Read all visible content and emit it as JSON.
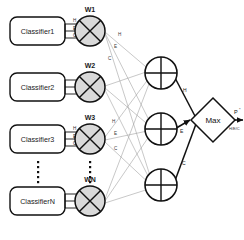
{
  "diagram": {
    "classifiers": [
      {
        "label": "Classifier1",
        "weight_label": "W1"
      },
      {
        "label": "Classifier2",
        "weight_label": "W2"
      },
      {
        "label": "Classifier3",
        "weight_label": "W3"
      },
      {
        "label": "ClassifierN",
        "weight_label": "WN"
      }
    ],
    "class_labels": [
      "H",
      "E",
      "C"
    ],
    "sum_nodes": [
      {
        "class_label": "H"
      },
      {
        "class_label": "E"
      },
      {
        "class_label": "C"
      }
    ],
    "decision_block": {
      "label": "Max"
    },
    "output": {
      "label": "P",
      "superscript": "*",
      "sublabel": "H/E/C"
    },
    "ellipsis_dots": "⋮",
    "colors": {
      "stroke": "#111111",
      "thin_stroke": "#9a9a9a",
      "multiplier_fill": "#d9d9d9",
      "background": "#ffffff",
      "box_fill": "#ffffff"
    }
  }
}
